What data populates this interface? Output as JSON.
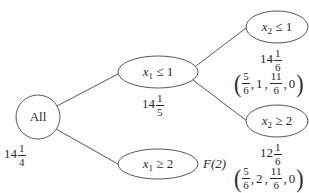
{
  "diagram": {
    "type": "branch-and-bound tree",
    "stroke_color": "#444444",
    "nodes": {
      "root": {
        "label": "All",
        "bound": {
          "whole": "14",
          "num": "1",
          "den": "4"
        }
      },
      "x1_le_1": {
        "var": "x",
        "sub": "1",
        "op": "≤",
        "val": "1",
        "bound": {
          "whole": "14",
          "num": "1",
          "den": "5"
        }
      },
      "x1_ge_2": {
        "var": "x",
        "sub": "1",
        "op": "≥",
        "val": "2",
        "status": "F(2)"
      },
      "x2_le_1": {
        "var": "x",
        "sub": "2",
        "op": "≤",
        "val": "1",
        "bound": {
          "whole": "14",
          "num": "1",
          "den": "6"
        },
        "solution": {
          "a_num": "5",
          "a_den": "6",
          "b": "1",
          "c_num": "11",
          "c_den": "6",
          "d": "0"
        }
      },
      "x2_ge_2": {
        "var": "x",
        "sub": "2",
        "op": "≥",
        "val": "2",
        "bound": {
          "whole": "12",
          "num": "1",
          "den": "6"
        },
        "solution": {
          "a_num": "5",
          "a_den": "6",
          "b": "2",
          "c_num": "11",
          "c_den": "6",
          "d": "0"
        }
      }
    },
    "edges": [
      [
        "root",
        "x1_le_1"
      ],
      [
        "root",
        "x1_ge_2"
      ],
      [
        "x1_le_1",
        "x2_le_1"
      ],
      [
        "x1_le_1",
        "x2_ge_2"
      ]
    ]
  }
}
